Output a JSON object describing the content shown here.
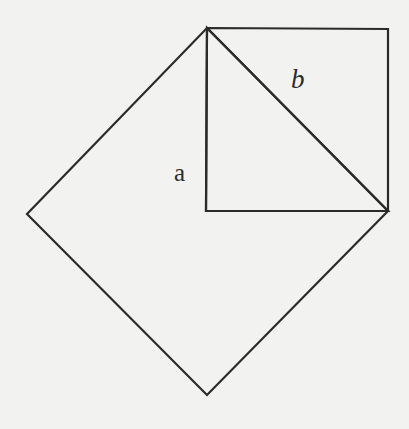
{
  "figure": {
    "kind": "geometry-diagram",
    "width": 409,
    "height": 429,
    "background_color": "#efefed",
    "paper_color": "#f4f4f2",
    "stroke_color": "#2b2b2b",
    "stroke_width": 2.2,
    "fill": "none"
  },
  "labels": [
    {
      "id": "leg-a",
      "text": "a",
      "style": "upright-serif",
      "x": 174,
      "y": 160,
      "font_size": 25,
      "describes": "vertical leg of the right triangle"
    },
    {
      "id": "hypotenuse-b",
      "text": "b",
      "style": "italic-serif",
      "x": 291,
      "y": 66,
      "font_size": 27,
      "describes": "hypotenuse of the right triangle"
    }
  ],
  "shapes": {
    "apex": {
      "x": 207,
      "y": 28
    },
    "right_angle_corner": {
      "x": 206,
      "y": 211
    },
    "base_right_corner": {
      "x": 388,
      "y": 211
    },
    "upright_square": {
      "name": "square-on-leg-a",
      "points": "207,28 388,29 388,211 206,211"
    },
    "right_triangle": {
      "name": "right-triangle",
      "points": "207,28 206,211 388,211"
    },
    "tilted_square": {
      "name": "square-on-hypotenuse",
      "points": "207,28 388,211 207,395 27,214"
    }
  }
}
